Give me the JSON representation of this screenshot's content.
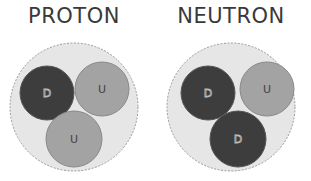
{
  "panels": [
    {
      "title": "PROTON",
      "quarks": [
        {
          "label": "D",
          "type": "down"
        },
        {
          "label": "U",
          "type": "up"
        },
        {
          "label": "U",
          "type": "up"
        }
      ]
    },
    {
      "title": "NEUTRON",
      "quarks": [
        {
          "label": "D",
          "type": "down"
        },
        {
          "label": "U",
          "type": "up"
        },
        {
          "label": "D",
          "type": "down"
        }
      ]
    }
  ],
  "colors": {
    "down": "#3d3d3d",
    "up": "#a3a3a3",
    "nucleon_fill": "#e6e6e6",
    "nucleon_border": "#9a9a9a",
    "title": "#3a3a3a"
  }
}
